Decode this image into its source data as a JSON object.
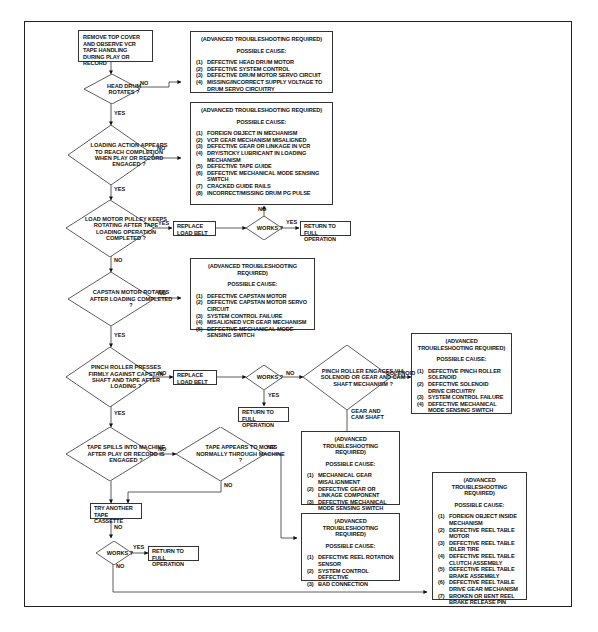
{
  "start": {
    "text": "REMOVE TOP COVER AND OBSERVE VCR TAPE HANDLING DURING PLAY OR RECORD"
  },
  "decisions": {
    "head_drum": "HEAD DRUM ROTATES ?",
    "loading": "LOADING ACTION APPEARS TO REACH COMPLETION WHEN PLAY OR RECORD ENGAGED ?",
    "load_motor": "LOAD MOTOR PULLEY KEEPS ROTATING AFTER TAPE LOADING OPERATION COMPLETED ?",
    "capstan": "CAPSTAN MOTOR ROTATES AFTER LOADING COMPLETED ?",
    "pinch": "PINCH ROLLER PRESSES FIRMLY AGAINST CAPSTAN SHAFT AND TAPE AFTER LOADING ?",
    "pinch_engage": "PINCH ROLLER ENGAGES VIA SOLENOID OR GEAR AND CAM SHAFT MECHANISM ?",
    "tape_spills": "TAPE SPILLS INTO MACHINE AFTER PLAY OR RECORD IS ENGAGED ?",
    "tape_moves": "TAPE APPEARS TO MOVE NORMALLY THROUGH MACHINE ?",
    "works_1": "WORKS ?",
    "works_2": "WORKS ?",
    "works_3": "WORKS ?"
  },
  "actions": {
    "replace_belt_1": "REPLACE LOAD BELT",
    "replace_belt_2": "REPLACE LOAD BELT",
    "return_1": "RETURN TO FULL OPERATION",
    "return_2": "RETURN TO FULL OPERATION",
    "return_3": "RETURN TO FULL OPERATION",
    "try_cassette": "TRY ANOTHER TAPE CASSETTE"
  },
  "labels": {
    "yes": "YES",
    "no": "NO",
    "solenoid": "SOLENOID",
    "gear_cam": "GEAR AND CAM SHAFT"
  },
  "cause_boxes": {
    "header": "(ADVANCED TROUBLESHOOTING REQUIRED)",
    "possible": "POSSIBLE CAUSE:",
    "head_drum": [
      "DEFECTIVE HEAD DRUM MOTOR",
      "DEFECTIVE SYSTEM CONTROL",
      "DEFECTIVE DRUM MOTOR SERVO CIRCUIT",
      "MISSING/INCORRECT SUPPLY VOLTAGE TO DRUM SERVO CIRCUITRY"
    ],
    "loading": [
      "FOREIGN OBJECT IN MECHANISM",
      "VCR GEAR MECHANISM MISALIGNED",
      "DEFECTIVE GEAR OR LINKAGE IN VCR",
      "DRY/STICKY LUBRICANT IN LOADING MECHANISM",
      "DEFECTIVE TAPE GUIDE",
      "DEFECTIVE MECHANICAL MODE SENSING SWITCH",
      "CRACKED GUIDE RAILS",
      "INCORRECT/MISSING DRUM PG PULSE"
    ],
    "capstan": [
      "DEFECTIVE CAPSTAN MOTOR",
      "DEFECTIVE CAPSTAN MOTOR SERVO CIRCUIT",
      "SYSTEM CONTROL FAILURE",
      "MISALIGNED VCR GEAR MECHANISM",
      "DEFECTIVE MECHANICAL MODE SENSING SWITCH"
    ],
    "solenoid": [
      "DEFECTIVE PINCH ROLLER SOLENOID",
      "DEFECTIVE SOLENOID DRIVE CIRCUITRY",
      "SYSTEM CONTROL FAILURE",
      "DEFECTIVE MECHANICAL MODE SENSING SWITCH"
    ],
    "gear_cam": [
      "MECHANICAL GEAR MISALIGNMENT",
      "DEFECTIVE GEAR OR LINKAGE COMPONENT",
      "DEFECTIVE MECHANICAL MODE SENSING SWITCH"
    ],
    "reel_sensor": [
      "DEFECTIVE REEL ROTATION SENSOR",
      "SYSTEM CONTROL DEFECTIVE",
      "BAD CONNECTION"
    ],
    "reel_table": [
      "FOREIGN OBJECT INSIDE MECHANISM",
      "DEFECTIVE REEL TABLE MOTOR",
      "DEFECTIVE REEL TABLE IDLER TIRE",
      "DEFECTIVE REEL TABLE CLUTCH ASSEMBLY",
      "DEFECTIVE REEL TABLE BRAKE ASSEMBLY",
      "DEFECTIVE REEL TABLE DRIVE GEAR MECHANISM",
      "BROKEN OR BENT REEL BRAKE RELEASE PIN"
    ]
  }
}
